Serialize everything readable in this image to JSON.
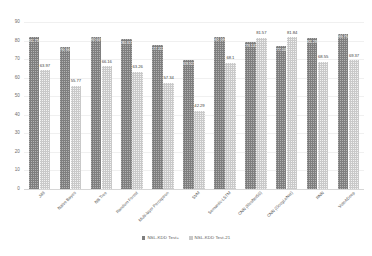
{
  "chart_data": {
    "type": "bar",
    "title": "",
    "xlabel": "",
    "ylabel": "",
    "ylim": [
      0,
      90
    ],
    "yticks": [
      0,
      10,
      20,
      30,
      40,
      50,
      60,
      70,
      80,
      90
    ],
    "grid": true,
    "legend_position": "bottom",
    "categories": [
      "J48",
      "Naïve Bayes",
      "NB Tree",
      "Random Forest",
      "Multi-layer Perceptron",
      "SVM",
      "Semantic-LSTM",
      "CNN (ResNet50)",
      "CNN (GoogLeNet)",
      "RNN",
      "VoteADeep"
    ],
    "series": [
      {
        "name": "NSL-KDD Test+",
        "color": "#7f7f7f",
        "values": [
          81.75,
          76.56,
          82.02,
          80.67,
          77.41,
          69.52,
          82.18,
          79.14,
          77.04,
          81.29,
          83.75
        ]
      },
      {
        "name": "NSL-KDD Test-21",
        "color": "#c9c9c9",
        "values": [
          63.97,
          55.77,
          66.16,
          63.26,
          57.34,
          42.29,
          68.1,
          81.57,
          81.84,
          68.55,
          69.37
        ]
      }
    ]
  }
}
